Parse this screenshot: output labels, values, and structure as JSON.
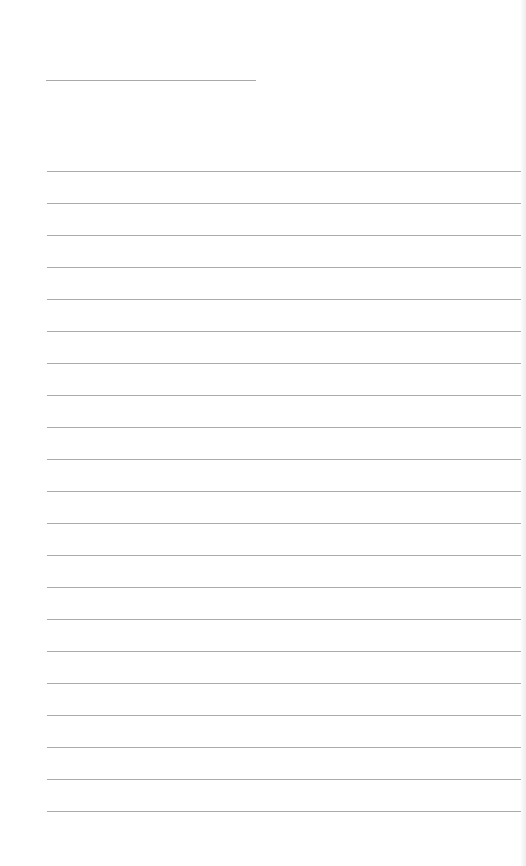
{
  "document": {
    "type": "lined-paper",
    "title_line": {
      "text": ""
    },
    "ruled_lines": {
      "count": 21,
      "first_y": 171,
      "spacing": 32,
      "entries": [
        "",
        "",
        "",
        "",
        "",
        "",
        "",
        "",
        "",
        "",
        "",
        "",
        "",
        "",
        "",
        "",
        "",
        "",
        "",
        "",
        ""
      ]
    },
    "colors": {
      "paper": "#ffffff",
      "rule": "#ababab"
    }
  }
}
